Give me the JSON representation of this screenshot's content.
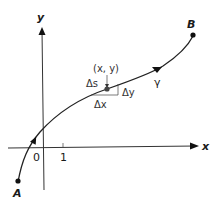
{
  "diagram": {
    "type": "curve-on-cartesian-axes",
    "axes": {
      "x_label": "x",
      "y_label": "y",
      "origin_label": "0",
      "unit_tick_label": "1"
    },
    "curve": {
      "name": "γ",
      "start_point_label": "A",
      "end_point_label": "B",
      "direction": "A to B"
    },
    "element": {
      "point_label": "(x, y)",
      "arc_length_label": "Δs",
      "dx_label": "Δx",
      "dy_label": "Δy"
    }
  }
}
